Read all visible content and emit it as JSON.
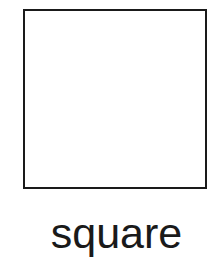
{
  "figure": {
    "shape": "square",
    "label": "square",
    "stroke_color": "#1a1a1a",
    "fill_color": "#ffffff"
  }
}
